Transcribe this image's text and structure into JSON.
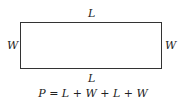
{
  "diagram": {
    "shape": "rectangle",
    "labels": {
      "top": "L",
      "bottom": "L",
      "left": "W",
      "right": "W"
    },
    "formula": {
      "text": "P = L + W + L + W",
      "parts": [
        "P",
        " = ",
        "L",
        " + ",
        "W",
        " + ",
        "L",
        " + ",
        "W"
      ]
    },
    "colors": {
      "stroke": "#333333",
      "text": "#222222",
      "background": "#ffffff"
    }
  }
}
